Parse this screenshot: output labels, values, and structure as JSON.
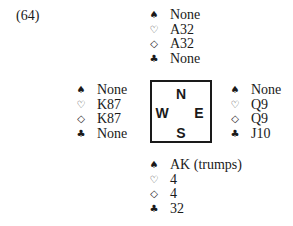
{
  "problem": {
    "number_label": "(64)"
  },
  "suit_icons": {
    "spades": "♠",
    "hearts": "♡",
    "diamonds": "◇",
    "clubs": "♣"
  },
  "compass": {
    "north": "N",
    "west": "W",
    "east": "E",
    "south": "S"
  },
  "hands": {
    "north": {
      "spades": "None",
      "hearts": "A32",
      "diamonds": "A32",
      "clubs": "None"
    },
    "west": {
      "spades": "None",
      "hearts": "K87",
      "diamonds": "K87",
      "clubs": "None"
    },
    "east": {
      "spades": "None",
      "hearts": "Q9",
      "diamonds": "Q9",
      "clubs": "J10"
    },
    "south": {
      "spades": "AK (trumps)",
      "hearts": "4",
      "diamonds": "4",
      "clubs": "32"
    }
  }
}
